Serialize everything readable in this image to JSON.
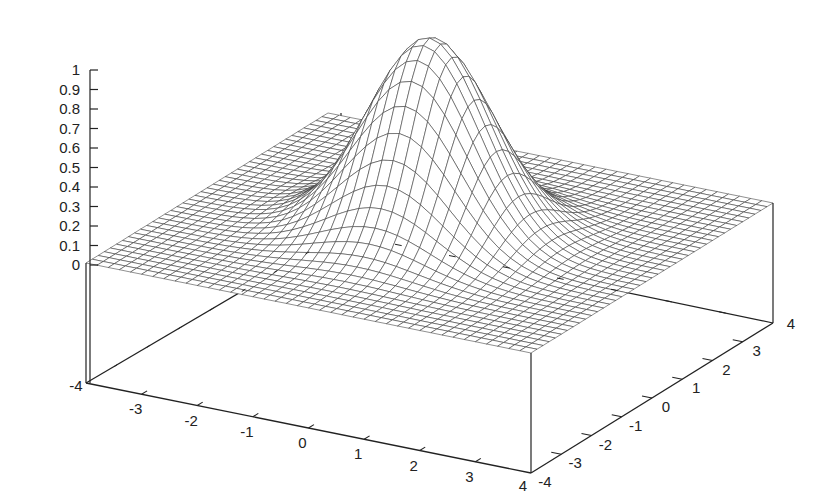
{
  "chart_data": {
    "type": "surface3d",
    "title": "",
    "function": "gaussian bump z = exp(-(x^2+y^2)/2)",
    "xlabel": "",
    "ylabel": "",
    "zlabel": "",
    "x_range": [
      -4,
      4
    ],
    "y_range": [
      -4,
      4
    ],
    "z_range": [
      0,
      1
    ],
    "x_ticks": [
      "-4",
      "-3",
      "-2",
      "-1",
      "0",
      "1",
      "2",
      "3",
      "4"
    ],
    "y_ticks": [
      "-4",
      "-3",
      "-2",
      "-1",
      "0",
      "1",
      "2",
      "3",
      "4"
    ],
    "z_ticks": [
      "0",
      "0.1",
      "0.2",
      "0.3",
      "0.4",
      "0.5",
      "0.6",
      "0.7",
      "0.8",
      "0.9",
      "1"
    ],
    "peak": {
      "x": 0,
      "y": 0,
      "z": 1
    },
    "grid_samples": 40,
    "style": "wireframe mesh with hidden-line removal",
    "colors": {
      "mesh": "#333333",
      "axes": "#222222",
      "background": "#ffffff"
    },
    "legend": "none",
    "grid": false
  }
}
